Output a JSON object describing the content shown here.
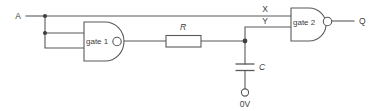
{
  "diagram": {
    "type": "logic-circuit-schematic",
    "title": "",
    "colors": {
      "wire": "#58595b",
      "text": "#404041",
      "background": "#ffffff",
      "node": "#404041"
    },
    "labels": {
      "input_a": "A",
      "node_x": "X",
      "node_y": "Y",
      "output_q": "Q",
      "gate1": "gate 1",
      "gate2": "gate 2",
      "resistor": "R",
      "capacitor": "C",
      "ground": "0V"
    },
    "components": [
      {
        "id": "gate1",
        "kind": "nand-gate",
        "label": "gate 1",
        "inputs": 2,
        "inverted_output": true
      },
      {
        "id": "gate2",
        "kind": "nand-gate",
        "label": "gate 2",
        "inputs": 2,
        "inverted_output": true
      },
      {
        "id": "R",
        "kind": "resistor",
        "label": "R"
      },
      {
        "id": "C",
        "kind": "capacitor",
        "label": "C"
      },
      {
        "id": "0V",
        "kind": "ground-terminal",
        "label": "0V"
      }
    ],
    "nets": [
      {
        "name": "A",
        "from": "input-a",
        "to": [
          "gate1.in1",
          "gate1.in2",
          "X"
        ]
      },
      {
        "name": "X",
        "from": "A",
        "to": [
          "gate2.in1"
        ]
      },
      {
        "name": "gate1-out",
        "from": "gate1.out",
        "to": [
          "R.left"
        ]
      },
      {
        "name": "Y",
        "from": "R.right",
        "to": [
          "C.top",
          "gate2.in2"
        ]
      },
      {
        "name": "Q",
        "from": "gate2.out",
        "to": [
          "output-q"
        ]
      },
      {
        "name": "0V",
        "from": "C.bottom",
        "to": [
          "ground-terminal"
        ]
      }
    ]
  }
}
